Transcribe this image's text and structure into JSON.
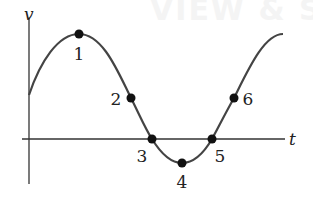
{
  "ghost_text": "VIEW & SOL",
  "axes": {
    "x_label": "t",
    "y_label": "v"
  },
  "points": [
    {
      "label": "1",
      "x": 79,
      "y": 34,
      "lx": 79,
      "ly": 60
    },
    {
      "label": "2",
      "x": 131,
      "y": 98,
      "lx": 116,
      "ly": 105
    },
    {
      "label": "3",
      "x": 152,
      "y": 139,
      "lx": 142,
      "ly": 162
    },
    {
      "label": "4",
      "x": 182,
      "y": 163,
      "lx": 182,
      "ly": 188
    },
    {
      "label": "5",
      "x": 212,
      "y": 139,
      "lx": 220,
      "ly": 162
    },
    {
      "label": "6",
      "x": 234,
      "y": 98,
      "lx": 248,
      "ly": 105
    }
  ],
  "colors": {
    "curve": "#444444",
    "axis": "#333333",
    "dot": "#111111"
  },
  "chart_data": {
    "type": "line",
    "title": "",
    "xlabel": "t",
    "ylabel": "v",
    "series": [
      {
        "name": "v(t)",
        "shape": "sinusoid"
      }
    ],
    "labeled_points": [
      "1 (maximum)",
      "2 (positive, decreasing)",
      "3 (zero crossing, decreasing)",
      "4 (minimum)",
      "5 (zero crossing, increasing)",
      "6 (positive, increasing)"
    ],
    "grid": false
  }
}
